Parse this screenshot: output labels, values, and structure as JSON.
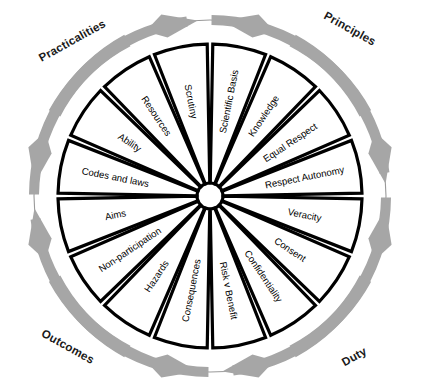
{
  "diagram": {
    "type": "radial-segmented-wheel",
    "segment_count": 16,
    "colors": {
      "wedge_fill": "#ffffff",
      "wedge_stroke": "#000000",
      "arrow": "#a6a6a6",
      "ring_line": "#9a9a9a",
      "label_text": "#000000",
      "quadrant_text": "#1a1a1a"
    },
    "center": {
      "cx": 210,
      "cy": 196,
      "hub_radius": 13,
      "outer_radius": 152,
      "ring_radius": 176
    }
  },
  "quadrants": [
    {
      "label": "Practicalities",
      "position": "top-left",
      "x": 74,
      "y": 44,
      "rotate": -29
    },
    {
      "label": "Principles",
      "position": "top-right",
      "x": 348,
      "y": 32,
      "rotate": 29
    },
    {
      "label": "Outcomes",
      "position": "bottom-left",
      "x": 66,
      "y": 350,
      "rotate": 29
    },
    {
      "label": "Duty",
      "position": "bottom-right",
      "x": 356,
      "y": 360,
      "rotate": -29
    }
  ],
  "segments": [
    {
      "label": "Scientific Basis",
      "index": 0,
      "mid_angle": 11.25,
      "group": "Principles",
      "flip": false
    },
    {
      "label": "Knowledge",
      "index": 1,
      "mid_angle": 33.75,
      "group": "Principles",
      "flip": false
    },
    {
      "label": "Equal Respect",
      "index": 2,
      "mid_angle": 56.25,
      "group": "Principles",
      "flip": false
    },
    {
      "label": "Respect Autonomy",
      "index": 3,
      "mid_angle": 78.75,
      "group": "Principles",
      "flip": false
    },
    {
      "label": "Veracity",
      "index": 4,
      "mid_angle": 101.25,
      "group": "Duty",
      "flip": false
    },
    {
      "label": "Consent",
      "index": 5,
      "mid_angle": 123.75,
      "group": "Duty",
      "flip": false
    },
    {
      "label": "Confidentiality",
      "index": 6,
      "mid_angle": 146.25,
      "group": "Duty",
      "flip": false
    },
    {
      "label": "Risk v Benefit",
      "index": 7,
      "mid_angle": 168.75,
      "group": "Duty",
      "flip": false
    },
    {
      "label": "Consequences",
      "index": 8,
      "mid_angle": 191.25,
      "group": "Outcomes",
      "flip": true
    },
    {
      "label": "Hazards",
      "index": 9,
      "mid_angle": 213.75,
      "group": "Outcomes",
      "flip": true
    },
    {
      "label": "Non-participation",
      "index": 10,
      "mid_angle": 236.25,
      "group": "Outcomes",
      "flip": true
    },
    {
      "label": "Aims",
      "index": 11,
      "mid_angle": 258.75,
      "group": "Outcomes",
      "flip": true
    },
    {
      "label": "Codes and laws",
      "index": 12,
      "mid_angle": 281.25,
      "group": "Practicalities",
      "flip": true
    },
    {
      "label": "Ability",
      "index": 13,
      "mid_angle": 303.75,
      "group": "Practicalities",
      "flip": true
    },
    {
      "label": "Resources",
      "index": 14,
      "mid_angle": 326.25,
      "group": "Practicalities",
      "flip": true
    },
    {
      "label": "Scrutiny",
      "index": 15,
      "mid_angle": 348.75,
      "group": "Practicalities",
      "flip": true
    }
  ],
  "arrows": {
    "description": "Eight grey curved arrows around the outer ring, converging in pairs at top, bottom, left and right.",
    "pairs": [
      {
        "meeting_point": "top",
        "angle": 0
      },
      {
        "meeting_point": "right",
        "angle": 90
      },
      {
        "meeting_point": "bottom",
        "angle": 180
      },
      {
        "meeting_point": "left",
        "angle": 270
      }
    ]
  }
}
